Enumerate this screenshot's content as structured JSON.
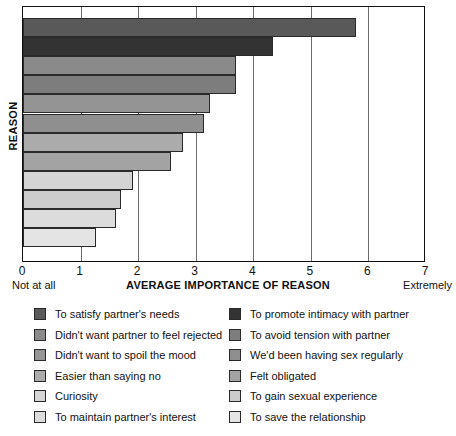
{
  "chart_data": {
    "type": "bar",
    "orientation": "horizontal",
    "title": "",
    "xlabel": "AVERAGE IMPORTANCE OF REASON",
    "ylabel": "REASON",
    "xlim": [
      0,
      7
    ],
    "xticks": [
      "0",
      "1",
      "2",
      "3",
      "4",
      "5",
      "6",
      "7"
    ],
    "xtick_values": [
      0,
      1,
      2,
      3,
      4,
      5,
      6,
      7
    ],
    "x_axis_min_label": "Not at all",
    "x_axis_max_label": "Extremely",
    "grid": true,
    "grid_axis": "x",
    "legend_position": "below",
    "categories": [
      "To satisfy partner's needs",
      "To promote intimacy with partner",
      "Didn't want partner to feel rejected",
      "To avoid tension with partner",
      "Didn't want to spoil the mood",
      "We'd been having sex regularly",
      "Easier than saying no",
      "Felt obligated",
      "Curiosity",
      "To gain sexual experience",
      "To maintain partner's interest",
      "To save the relationship"
    ],
    "values": [
      5.78,
      4.34,
      3.7,
      3.7,
      3.25,
      3.14,
      2.78,
      2.57,
      1.91,
      1.7,
      1.61,
      1.27
    ],
    "colors": [
      "#595959",
      "#333333",
      "#8a8a8a",
      "#7d7d7d",
      "#949494",
      "#8f8f8f",
      "#ababab",
      "#a3a3a3",
      "#d4d4d4",
      "#cccccc",
      "#dcdcdc",
      "#e4e4e4"
    ]
  },
  "legend": {
    "left_column": [
      {
        "label": "To satisfy partner's needs",
        "color": "#595959"
      },
      {
        "label": "Didn't want partner to feel rejected",
        "color": "#8a8a8a"
      },
      {
        "label": "Didn't want to spoil the mood",
        "color": "#949494"
      },
      {
        "label": "Easier than saying no",
        "color": "#ababab"
      },
      {
        "label": "Curiosity",
        "color": "#d4d4d4"
      },
      {
        "label": "To maintain partner's interest",
        "color": "#dcdcdc"
      }
    ],
    "right_column": [
      {
        "label": "To promote intimacy with partner",
        "color": "#333333"
      },
      {
        "label": "To avoid tension with partner",
        "color": "#7d7d7d"
      },
      {
        "label": "We'd been having sex regularly",
        "color": "#8f8f8f"
      },
      {
        "label": "Felt obligated",
        "color": "#a3a3a3"
      },
      {
        "label": "To gain sexual experience",
        "color": "#cccccc"
      },
      {
        "label": "To save the relationship",
        "color": "#e4e4e4"
      }
    ]
  }
}
